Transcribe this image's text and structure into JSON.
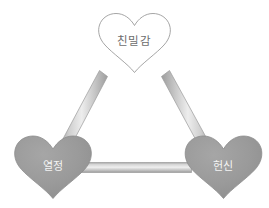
{
  "diagram": {
    "type": "triangular-theory-of-love",
    "background_color": "#ffffff",
    "nodes": [
      {
        "id": "intimacy",
        "label": "친밀감",
        "position": "top-center",
        "shape": "heart",
        "fill_color": "#ffffff",
        "stroke_color": "#9b9b9b",
        "text_color": "#6d6d6d"
      },
      {
        "id": "passion",
        "label": "열정",
        "position": "bottom-left",
        "shape": "heart",
        "fill_color": "#9a9a9a",
        "stroke_color": "#8b8b8b",
        "text_color": "#f4f4f4"
      },
      {
        "id": "commitment",
        "label": "헌신",
        "position": "bottom-right",
        "shape": "heart",
        "fill_color": "#9a9a9a",
        "stroke_color": "#8b8b8b",
        "text_color": "#f4f4f4"
      }
    ],
    "connectors": [
      {
        "id": "intimacy-passion",
        "from": "intimacy",
        "to": "passion",
        "style": "3d-beam",
        "color_light": "#e8e8e8",
        "color_dark": "#9d9d9d"
      },
      {
        "id": "intimacy-commitment",
        "from": "intimacy",
        "to": "commitment",
        "style": "3d-beam",
        "color_light": "#e8e8e8",
        "color_dark": "#9d9d9d"
      },
      {
        "id": "passion-commitment",
        "from": "passion",
        "to": "commitment",
        "style": "3d-beam",
        "color_light": "#e8e8e8",
        "color_dark": "#9d9d9d"
      }
    ]
  }
}
